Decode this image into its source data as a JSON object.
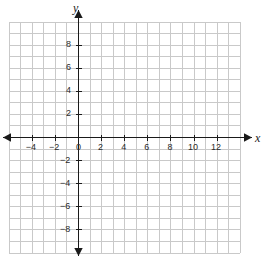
{
  "chart_data": {
    "type": "scatter",
    "title": "",
    "xlabel": "x",
    "ylabel": "y",
    "grid": true,
    "legend": null,
    "xlim": [
      -6,
      14
    ],
    "ylim": [
      -10,
      10
    ],
    "x_tick_step": 2,
    "y_tick_step": 2,
    "grid_step": 1,
    "x_tick_labels": [
      "-4",
      "-2",
      "0",
      "2",
      "4",
      "6",
      "8",
      "10",
      "12"
    ],
    "x_tick_values": [
      -4,
      -2,
      0,
      2,
      4,
      6,
      8,
      10,
      12
    ],
    "y_tick_labels": [
      "8",
      "6",
      "4",
      "2",
      "-2",
      "-4",
      "-6",
      "-8"
    ],
    "y_tick_values": [
      8,
      6,
      4,
      2,
      -2,
      -4,
      -6,
      -8
    ],
    "origin_label": "0",
    "series": [],
    "values": [],
    "annotations": [],
    "axis_arrows": [
      "left",
      "right",
      "up",
      "down"
    ],
    "colors": {
      "grid": "#c9c9c9",
      "axis": "#1a1a1a",
      "label": "#2b2b2b",
      "background": "#ffffff"
    }
  },
  "axes": {
    "x_name": "x",
    "y_name": "y"
  },
  "ticks": {
    "x": [
      {
        "label": "-4",
        "value": -4
      },
      {
        "label": "-2",
        "value": -2
      },
      {
        "label": "0",
        "value": 0
      },
      {
        "label": "2",
        "value": 2
      },
      {
        "label": "4",
        "value": 4
      },
      {
        "label": "6",
        "value": 6
      },
      {
        "label": "8",
        "value": 8
      },
      {
        "label": "10",
        "value": 10
      },
      {
        "label": "12",
        "value": 12
      }
    ],
    "y": [
      {
        "label": "8",
        "value": 8
      },
      {
        "label": "6",
        "value": 6
      },
      {
        "label": "4",
        "value": 4
      },
      {
        "label": "2",
        "value": 2
      },
      {
        "label": "-2",
        "value": -2
      },
      {
        "label": "-4",
        "value": -4
      },
      {
        "label": "-6",
        "value": -6
      },
      {
        "label": "-8",
        "value": -8
      }
    ]
  }
}
